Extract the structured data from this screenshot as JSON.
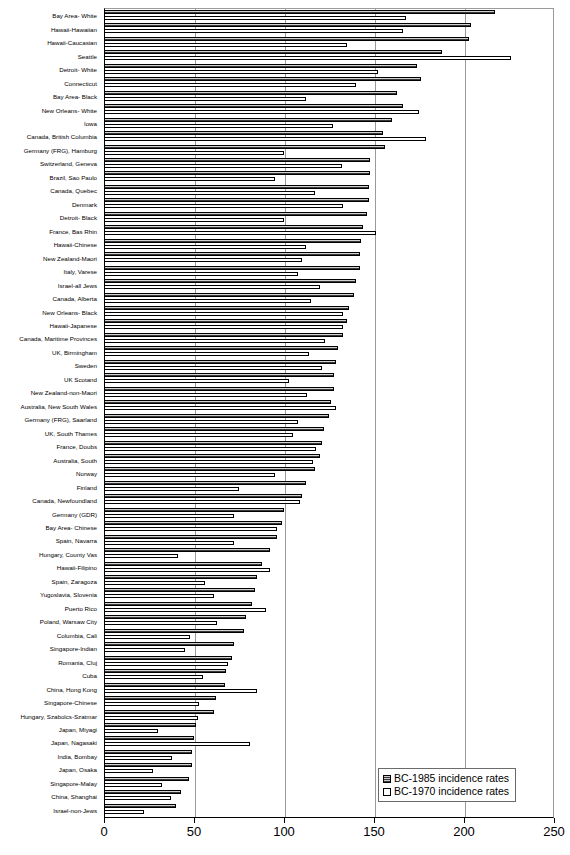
{
  "chart_data": {
    "type": "bar",
    "orientation": "horizontal",
    "title": "",
    "xlabel": "",
    "ylabel": "",
    "xlim": [
      0,
      250
    ],
    "xticks": [
      0,
      50,
      100,
      150,
      200,
      250
    ],
    "grid": true,
    "legend_position": "bottom-right",
    "categories": [
      "Bay Area- White",
      "Hawaii-Hawaiian",
      "Hawaii-Caucasian",
      "Seattle",
      "Detroit- White",
      "Connecticut",
      "Bay Area- Black",
      "New Orleans- White",
      "Iowa",
      "Canada, British Columbia",
      "Germany (FRG), Hamburg",
      "Switzerland, Geneva",
      "Brazil, Sao Paulo",
      "Canada, Quebec",
      "Denmark",
      "Detroit- Black",
      "France, Bas Rhin",
      "Hawaii-Chinese",
      "New Zealand-Maori",
      "Italy, Varese",
      "Israel-all Jews",
      "Canada, Alberta",
      "New Orleans- Black",
      "Hawaii-Japanese",
      "Canada, Maritime Provinces",
      "UK, Birmingham",
      "Sweden",
      "UK Scotand",
      "New Zealand-non-Maori",
      "Australia, New South Wales",
      "Germany (FRG), Saarland",
      "UK, South Thames",
      "France, Doubs",
      "Australia, South",
      "Norway",
      "Finland",
      "Canada, Newfoundland",
      "Germany (GDR)",
      "Bay Area- Chinese",
      "Spain, Navarra",
      "Hungary, County Vas",
      "Hawaii-Filipino",
      "Spain, Zaragoza",
      "Yugoslavia, Slovenia",
      "Puerto Rico",
      "Poland, Warsaw City",
      "Columbia, Cali",
      "Singapore-Indian",
      "Romania, Cluj",
      "Cuba",
      "China, Hong Kong",
      "Singapore-Chinese",
      "Hungary, Szabolcs-Szatmar",
      "Japan, Miyagi",
      "Japan, Nagasaki",
      "India, Bombay",
      "Japan, Osaka",
      "Singapore-Malay",
      "China, Shanghai",
      "Israel-non-Jews"
    ],
    "series": [
      {
        "name": "BC-1985 incidence rates",
        "style": "hatched-gray",
        "values": [
          217,
          204,
          203,
          188,
          174,
          176,
          163,
          166,
          160,
          155,
          156,
          148,
          148,
          147,
          147,
          146,
          144,
          143,
          142,
          142,
          140,
          139,
          136,
          135,
          133,
          130,
          129,
          128,
          128,
          126,
          125,
          122,
          121,
          120,
          117,
          112,
          110,
          100,
          99,
          96,
          92,
          88,
          85,
          84,
          82,
          79,
          78,
          72,
          71,
          68,
          67,
          62,
          61,
          51,
          50,
          49,
          49,
          47,
          43,
          40
        ]
      },
      {
        "name": "BC-1970 incidence rates",
        "style": "white-outline",
        "values": [
          168,
          166,
          135,
          226,
          152,
          140,
          112,
          175,
          127,
          179,
          100,
          132,
          95,
          117,
          133,
          100,
          151,
          112,
          110,
          108,
          120,
          115,
          133,
          133,
          123,
          114,
          121,
          103,
          113,
          129,
          108,
          105,
          118,
          116,
          95,
          75,
          109,
          72,
          96,
          72,
          41,
          92,
          56,
          61,
          90,
          63,
          48,
          45,
          69,
          55,
          85,
          53,
          52,
          30,
          81,
          38,
          27,
          32,
          37,
          22
        ]
      }
    ]
  },
  "legend": {
    "items": [
      {
        "label": "BC-1985 incidence rates",
        "swatch": "hatched-gray-swatch"
      },
      {
        "label": "BC-1970 incidence rates",
        "swatch": "white-swatch"
      }
    ]
  },
  "axis": {
    "tick_labels": [
      "0",
      "50",
      "100",
      "150",
      "200",
      "250"
    ]
  },
  "footer": {
    "caption": ""
  }
}
